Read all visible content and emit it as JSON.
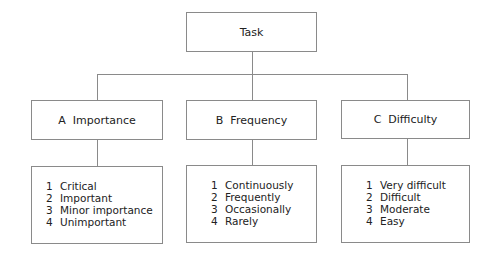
{
  "root": {
    "label": "Task"
  },
  "categories": [
    {
      "label": "A  Importance",
      "items": [
        {
          "num": "1",
          "label": "Critical"
        },
        {
          "num": "2",
          "label": "Important"
        },
        {
          "num": "3",
          "label": "Minor importance"
        },
        {
          "num": "4",
          "label": "Unimportant"
        }
      ]
    },
    {
      "label": "B  Frequency",
      "items": [
        {
          "num": "1",
          "label": "Continuously"
        },
        {
          "num": "2",
          "label": "Frequently"
        },
        {
          "num": "3",
          "label": "Occasionally"
        },
        {
          "num": "4",
          "label": "Rarely"
        }
      ]
    },
    {
      "label": "C  Difficulty",
      "items": [
        {
          "num": "1",
          "label": "Very difficult"
        },
        {
          "num": "2",
          "label": "Difficult"
        },
        {
          "num": "3",
          "label": "Moderate"
        },
        {
          "num": "4",
          "label": "Easy"
        }
      ]
    }
  ],
  "colors": {
    "line": "#8a8a8a",
    "text": "#222222",
    "background": "#ffffff"
  }
}
